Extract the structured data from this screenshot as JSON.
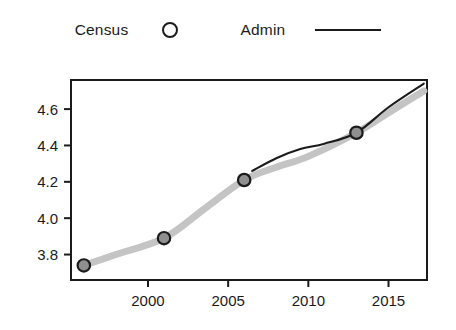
{
  "legend": {
    "entries": [
      {
        "label": "Census",
        "marker": "open-circle-marker"
      },
      {
        "label": "Admin",
        "marker": "solid-line-marker"
      }
    ]
  },
  "axes": {
    "y_ticks": [
      "3.8",
      "4.0",
      "4.2",
      "4.4",
      "4.6"
    ],
    "x_ticks": [
      "2000",
      "2005",
      "2010",
      "2015"
    ],
    "y_label": "",
    "x_label": ""
  },
  "colors": {
    "census_band": "#c4c4c4",
    "admin_line": "#1b1b1b",
    "axis": "#1b1b1b",
    "marker_fill": "#8f8f8f",
    "background": "#ffffff"
  },
  "chart_data": {
    "type": "line",
    "title": "",
    "xlabel": "",
    "ylabel": "",
    "xlim": [
      1995.2,
      1996.2
    ],
    "xlim_actual": [
      1995.2,
      2017.4
    ],
    "ylim": [
      3.66,
      4.76
    ],
    "grid": false,
    "legend_position": "top-center",
    "series": [
      {
        "name": "Census",
        "type": "scatter-with-band",
        "marker": "open-circle",
        "points": [
          {
            "x": 1996.0,
            "y": 3.74
          },
          {
            "x": 2001.0,
            "y": 3.89
          },
          {
            "x": 2006.0,
            "y": 4.21
          },
          {
            "x": 2013.0,
            "y": 4.47
          }
        ],
        "band_path": [
          {
            "x": 1996.0,
            "y": 3.74
          },
          {
            "x": 1998.0,
            "y": 3.8
          },
          {
            "x": 2001.0,
            "y": 3.89
          },
          {
            "x": 2003.5,
            "y": 4.05
          },
          {
            "x": 2006.0,
            "y": 4.21
          },
          {
            "x": 2008.0,
            "y": 4.28
          },
          {
            "x": 2010.0,
            "y": 4.34
          },
          {
            "x": 2013.0,
            "y": 4.47
          },
          {
            "x": 2015.0,
            "y": 4.58
          },
          {
            "x": 2017.2,
            "y": 4.7
          }
        ]
      },
      {
        "name": "Admin",
        "type": "line",
        "points": [
          {
            "x": 2006.5,
            "y": 4.26
          },
          {
            "x": 2008.0,
            "y": 4.33
          },
          {
            "x": 2009.5,
            "y": 4.38
          },
          {
            "x": 2011.0,
            "y": 4.41
          },
          {
            "x": 2013.0,
            "y": 4.47
          },
          {
            "x": 2015.0,
            "y": 4.61
          },
          {
            "x": 2017.2,
            "y": 4.74
          }
        ]
      }
    ]
  }
}
